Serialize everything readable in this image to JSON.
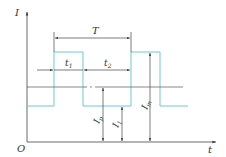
{
  "diagram": {
    "type": "pulse-current-waveform",
    "axes": {
      "y_label": "I",
      "x_label": "t",
      "origin_label": "O"
    },
    "dimensions": {
      "period": "T",
      "pulse_on_time": "t",
      "pulse_on_sub": "1",
      "pulse_off_time": "t",
      "pulse_off_sub": "2",
      "average_current": "I",
      "average_current_sub": "p",
      "base_current": "I",
      "base_current_sub": "1",
      "peak_current": "I",
      "peak_current_sub": "m"
    },
    "colors": {
      "waveform": "#6cc9d8",
      "lines": "#444444"
    }
  }
}
